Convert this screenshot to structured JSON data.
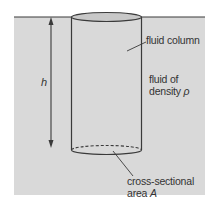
{
  "diagram": {
    "labels": {
      "height_symbol": "h",
      "fluid_column": "fluid column",
      "fluid_density_line1": "fluid of",
      "fluid_density_line2": "density",
      "density_symbol": "ρ",
      "cross_section_line1": "cross-sectional",
      "cross_section_line2": "area",
      "area_symbol": "A"
    },
    "colors": {
      "fluid_fill": "#d9d9d9",
      "column_top_fill": "#c8c8c8",
      "line": "#3a3a3a",
      "background": "#ffffff"
    }
  }
}
